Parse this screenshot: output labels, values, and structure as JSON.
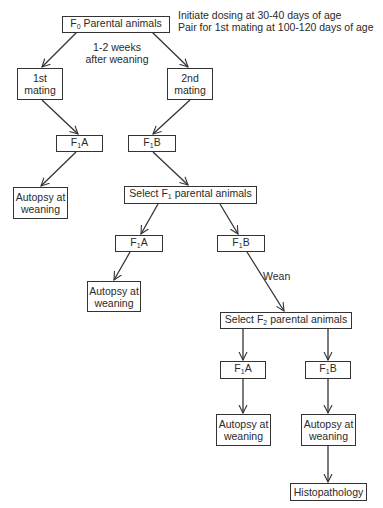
{
  "nodes": {
    "f0": {
      "prefix": "F",
      "sub": "0",
      "suffix": " Parental animals"
    },
    "mating1": {
      "line1": "1st",
      "line2": "mating"
    },
    "mating2": {
      "line1": "2nd",
      "line2": "mating"
    },
    "f1a_1": {
      "prefix": "F",
      "sub": "1",
      "suffix": "A"
    },
    "f1b_1": {
      "prefix": "F",
      "sub": "1",
      "suffix": "B"
    },
    "autopsy_1": {
      "line1": "Autopsy at",
      "line2": "weaning"
    },
    "select_f1": {
      "prefix": "Select F",
      "sub": "1",
      "suffix": " parental animals"
    },
    "f1a_2": {
      "prefix": "F",
      "sub": "1",
      "suffix": "A"
    },
    "f1b_2": {
      "prefix": "F",
      "sub": "1",
      "suffix": "B"
    },
    "autopsy_2": {
      "line1": "Autopsy at",
      "line2": "weaning"
    },
    "select_f2": {
      "prefix": "Select F",
      "sub": "2",
      "suffix": " parental animals"
    },
    "f1a_3": {
      "prefix": "F",
      "sub": "1",
      "suffix": "A"
    },
    "f1b_3": {
      "prefix": "F",
      "sub": "1",
      "suffix": "B"
    },
    "autopsy_3": {
      "line1": "Autopsy at",
      "line2": "weaning"
    },
    "autopsy_4": {
      "line1": "Autopsy at",
      "line2": "weaning"
    },
    "histopathology": {
      "label": "Histopathology"
    }
  },
  "annotations": {
    "dosing": {
      "line1": "Initiate dosing at 30-40 days of age",
      "line2": "Pair for 1st mating at 100-120 days of age"
    },
    "interval": {
      "line1": "1-2 weeks",
      "line2": "after weaning"
    },
    "wean": "Wean"
  },
  "colors": {
    "line": "#333333",
    "text": "#2a2a2a",
    "background": "#ffffff"
  }
}
